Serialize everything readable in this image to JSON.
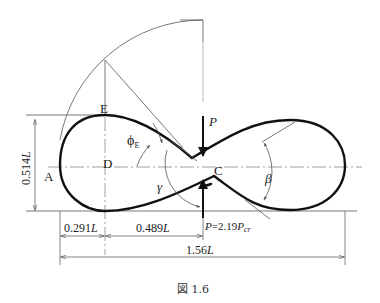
{
  "figure": {
    "caption": "図 1.6",
    "points": {
      "A": "A",
      "C": "C",
      "D": "D",
      "E": "E"
    },
    "angles": {
      "phi": "ϕ",
      "phi_sub": "E",
      "gamma": "γ",
      "beta": "β"
    },
    "loads": {
      "top": "P",
      "bottom_prefix": "P",
      "bottom_eq": "=2.19",
      "bottom_P": "P",
      "bottom_sub": "cr"
    },
    "dimensions": {
      "height": "0.514",
      "height_unit": "L",
      "left_width": "0.291",
      "left_width_unit": "L",
      "mid_width": "0.489",
      "mid_width_unit": "L",
      "total_width": "1.56",
      "total_width_unit": "L"
    }
  }
}
